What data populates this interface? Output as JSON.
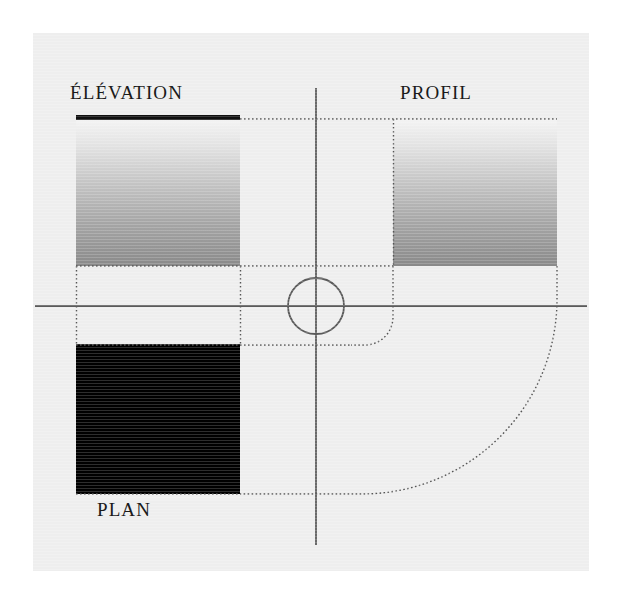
{
  "page": {
    "background_color": "#ffffff",
    "canvas_color": "#eeeeee",
    "width": 621,
    "height": 602
  },
  "labels": {
    "elevation": "ÉLÉVATION",
    "profil": "PROFIL",
    "plan": "PLAN"
  },
  "drawing": {
    "title_rule_color": "#000000",
    "axis_color": "#555555",
    "dotted_color": "#555555",
    "plan_fill": "#000000",
    "gradient_top_color": "#f2f2f2",
    "gradient_bottom_color": "#8e8e8e",
    "center_circle": {
      "cx": 283,
      "cy": 273,
      "r": 28,
      "stroke": "#555555"
    },
    "views": [
      {
        "name": "elevation",
        "label": "ÉLÉVATION",
        "fill": "gradient"
      },
      {
        "name": "profil",
        "label": "PROFIL",
        "fill": "gradient"
      },
      {
        "name": "plan",
        "label": "PLAN",
        "fill": "solid-black"
      }
    ]
  }
}
